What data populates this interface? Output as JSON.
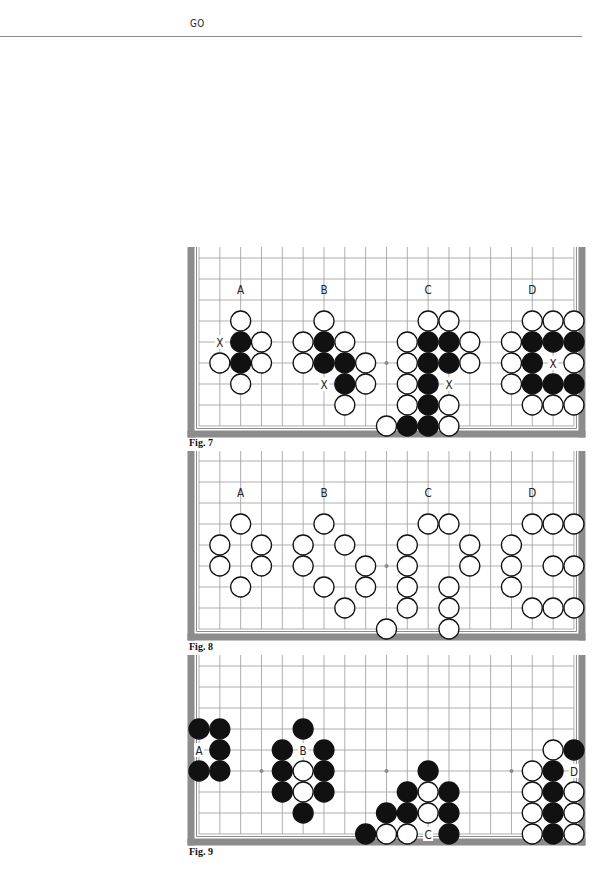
{
  "page": {
    "running_head": "GO"
  },
  "board": {
    "x0": 199,
    "col_spacing": 20.83,
    "row_spacing": 21,
    "cols": 19,
    "rows": 9,
    "stone_radius": 10,
    "frame_color": "#8c8c8c",
    "grid_color": "#9a9a9a",
    "star_points": [
      [
        3,
        5
      ],
      [
        9,
        5
      ],
      [
        15,
        5
      ]
    ]
  },
  "figures": [
    {
      "id": "fig7",
      "caption": "Fig. 7",
      "top": 247,
      "row0_y": 258,
      "caption_y": 437,
      "labels": [
        {
          "text": "A",
          "col": 2,
          "row": 1.5
        },
        {
          "text": "B",
          "col": 6,
          "row": 1.5
        },
        {
          "text": "C",
          "col": 11,
          "row": 1.5
        },
        {
          "text": "D",
          "col": 16,
          "row": 1.5
        },
        {
          "text": "X",
          "col": 1,
          "row": 4
        },
        {
          "text": "X",
          "col": 6,
          "row": 6
        },
        {
          "text": "X",
          "col": 12,
          "row": 6
        },
        {
          "text": "X",
          "col": 17,
          "row": 5
        }
      ],
      "stones": [
        {
          "c": "W",
          "col": 2,
          "row": 3
        },
        {
          "c": "B",
          "col": 2,
          "row": 4
        },
        {
          "c": "W",
          "col": 3,
          "row": 4
        },
        {
          "c": "W",
          "col": 1,
          "row": 5
        },
        {
          "c": "B",
          "col": 2,
          "row": 5
        },
        {
          "c": "W",
          "col": 3,
          "row": 5
        },
        {
          "c": "W",
          "col": 2,
          "row": 6
        },
        {
          "c": "W",
          "col": 6,
          "row": 3
        },
        {
          "c": "W",
          "col": 5,
          "row": 4
        },
        {
          "c": "B",
          "col": 6,
          "row": 4
        },
        {
          "c": "W",
          "col": 7,
          "row": 4
        },
        {
          "c": "W",
          "col": 5,
          "row": 5
        },
        {
          "c": "B",
          "col": 6,
          "row": 5
        },
        {
          "c": "B",
          "col": 7,
          "row": 5
        },
        {
          "c": "W",
          "col": 8,
          "row": 5
        },
        {
          "c": "B",
          "col": 7,
          "row": 6
        },
        {
          "c": "W",
          "col": 8,
          "row": 6
        },
        {
          "c": "W",
          "col": 7,
          "row": 7
        },
        {
          "c": "W",
          "col": 11,
          "row": 3
        },
        {
          "c": "W",
          "col": 12,
          "row": 3
        },
        {
          "c": "W",
          "col": 10,
          "row": 4
        },
        {
          "c": "B",
          "col": 11,
          "row": 4
        },
        {
          "c": "B",
          "col": 12,
          "row": 4
        },
        {
          "c": "W",
          "col": 13,
          "row": 4
        },
        {
          "c": "W",
          "col": 10,
          "row": 5
        },
        {
          "c": "B",
          "col": 11,
          "row": 5
        },
        {
          "c": "B",
          "col": 12,
          "row": 5
        },
        {
          "c": "W",
          "col": 13,
          "row": 5
        },
        {
          "c": "W",
          "col": 10,
          "row": 6
        },
        {
          "c": "B",
          "col": 11,
          "row": 6
        },
        {
          "c": "W",
          "col": 10,
          "row": 7
        },
        {
          "c": "B",
          "col": 11,
          "row": 7
        },
        {
          "c": "W",
          "col": 12,
          "row": 7
        },
        {
          "c": "W",
          "col": 9,
          "row": 8
        },
        {
          "c": "B",
          "col": 10,
          "row": 8
        },
        {
          "c": "B",
          "col": 11,
          "row": 8
        },
        {
          "c": "W",
          "col": 12,
          "row": 8
        },
        {
          "c": "W",
          "col": 16,
          "row": 3
        },
        {
          "c": "W",
          "col": 17,
          "row": 3
        },
        {
          "c": "W",
          "col": 18,
          "row": 3
        },
        {
          "c": "W",
          "col": 15,
          "row": 4
        },
        {
          "c": "B",
          "col": 16,
          "row": 4
        },
        {
          "c": "B",
          "col": 17,
          "row": 4
        },
        {
          "c": "B",
          "col": 18,
          "row": 4
        },
        {
          "c": "W",
          "col": 15,
          "row": 5
        },
        {
          "c": "B",
          "col": 16,
          "row": 5
        },
        {
          "c": "W",
          "col": 18,
          "row": 5
        },
        {
          "c": "W",
          "col": 15,
          "row": 6
        },
        {
          "c": "B",
          "col": 16,
          "row": 6
        },
        {
          "c": "B",
          "col": 17,
          "row": 6
        },
        {
          "c": "B",
          "col": 18,
          "row": 6
        },
        {
          "c": "W",
          "col": 16,
          "row": 7
        },
        {
          "c": "W",
          "col": 17,
          "row": 7
        },
        {
          "c": "W",
          "col": 18,
          "row": 7
        }
      ]
    },
    {
      "id": "fig8",
      "caption": "Fig. 8",
      "top": 451,
      "row0_y": 461,
      "caption_y": 641,
      "labels": [
        {
          "text": "A",
          "col": 2,
          "row": 1.5
        },
        {
          "text": "B",
          "col": 6,
          "row": 1.5
        },
        {
          "text": "C",
          "col": 11,
          "row": 1.5
        },
        {
          "text": "D",
          "col": 16,
          "row": 1.5
        }
      ],
      "stones": [
        {
          "c": "W",
          "col": 2,
          "row": 3
        },
        {
          "c": "W",
          "col": 1,
          "row": 4
        },
        {
          "c": "W",
          "col": 3,
          "row": 4
        },
        {
          "c": "W",
          "col": 1,
          "row": 5
        },
        {
          "c": "W",
          "col": 3,
          "row": 5
        },
        {
          "c": "W",
          "col": 2,
          "row": 6
        },
        {
          "c": "W",
          "col": 6,
          "row": 3
        },
        {
          "c": "W",
          "col": 5,
          "row": 4
        },
        {
          "c": "W",
          "col": 7,
          "row": 4
        },
        {
          "c": "W",
          "col": 5,
          "row": 5
        },
        {
          "c": "W",
          "col": 8,
          "row": 5
        },
        {
          "c": "W",
          "col": 6,
          "row": 6
        },
        {
          "c": "W",
          "col": 8,
          "row": 6
        },
        {
          "c": "W",
          "col": 7,
          "row": 7
        },
        {
          "c": "W",
          "col": 11,
          "row": 3
        },
        {
          "c": "W",
          "col": 12,
          "row": 3
        },
        {
          "c": "W",
          "col": 10,
          "row": 4
        },
        {
          "c": "W",
          "col": 13,
          "row": 4
        },
        {
          "c": "W",
          "col": 10,
          "row": 5
        },
        {
          "c": "W",
          "col": 13,
          "row": 5
        },
        {
          "c": "W",
          "col": 10,
          "row": 6
        },
        {
          "c": "W",
          "col": 12,
          "row": 6
        },
        {
          "c": "W",
          "col": 10,
          "row": 7
        },
        {
          "c": "W",
          "col": 12,
          "row": 7
        },
        {
          "c": "W",
          "col": 9,
          "row": 8
        },
        {
          "c": "W",
          "col": 12,
          "row": 8
        },
        {
          "c": "W",
          "col": 16,
          "row": 3
        },
        {
          "c": "W",
          "col": 17,
          "row": 3
        },
        {
          "c": "W",
          "col": 18,
          "row": 3
        },
        {
          "c": "W",
          "col": 15,
          "row": 4
        },
        {
          "c": "W",
          "col": 15,
          "row": 5
        },
        {
          "c": "W",
          "col": 17,
          "row": 5
        },
        {
          "c": "W",
          "col": 18,
          "row": 5
        },
        {
          "c": "W",
          "col": 15,
          "row": 6
        },
        {
          "c": "W",
          "col": 16,
          "row": 7
        },
        {
          "c": "W",
          "col": 17,
          "row": 7
        },
        {
          "c": "W",
          "col": 18,
          "row": 7
        }
      ]
    },
    {
      "id": "fig9",
      "caption": "Fig. 9",
      "top": 655,
      "row0_y": 666,
      "caption_y": 846,
      "labels": [
        {
          "text": "A",
          "col": 0,
          "row": 4
        },
        {
          "text": "B",
          "col": 5,
          "row": 4
        },
        {
          "text": "C",
          "col": 11,
          "row": 8
        },
        {
          "text": "D",
          "col": 18,
          "row": 5
        }
      ],
      "stones": [
        {
          "c": "B",
          "col": 0,
          "row": 3
        },
        {
          "c": "B",
          "col": 1,
          "row": 3
        },
        {
          "c": "B",
          "col": 1,
          "row": 4
        },
        {
          "c": "B",
          "col": 0,
          "row": 5
        },
        {
          "c": "B",
          "col": 1,
          "row": 5
        },
        {
          "c": "B",
          "col": 5,
          "row": 3
        },
        {
          "c": "B",
          "col": 4,
          "row": 4
        },
        {
          "c": "B",
          "col": 6,
          "row": 4
        },
        {
          "c": "B",
          "col": 4,
          "row": 5
        },
        {
          "c": "W",
          "col": 5,
          "row": 5
        },
        {
          "c": "B",
          "col": 6,
          "row": 5
        },
        {
          "c": "B",
          "col": 4,
          "row": 6
        },
        {
          "c": "W",
          "col": 5,
          "row": 6
        },
        {
          "c": "B",
          "col": 6,
          "row": 6
        },
        {
          "c": "B",
          "col": 5,
          "row": 7
        },
        {
          "c": "B",
          "col": 11,
          "row": 5
        },
        {
          "c": "B",
          "col": 10,
          "row": 6
        },
        {
          "c": "W",
          "col": 11,
          "row": 6
        },
        {
          "c": "B",
          "col": 12,
          "row": 6
        },
        {
          "c": "B",
          "col": 9,
          "row": 7
        },
        {
          "c": "B",
          "col": 10,
          "row": 7
        },
        {
          "c": "W",
          "col": 11,
          "row": 7
        },
        {
          "c": "B",
          "col": 12,
          "row": 7
        },
        {
          "c": "B",
          "col": 8,
          "row": 8
        },
        {
          "c": "W",
          "col": 9,
          "row": 8
        },
        {
          "c": "W",
          "col": 10,
          "row": 8
        },
        {
          "c": "B",
          "col": 12,
          "row": 8
        },
        {
          "c": "W",
          "col": 17,
          "row": 4
        },
        {
          "c": "B",
          "col": 18,
          "row": 4
        },
        {
          "c": "W",
          "col": 16,
          "row": 5
        },
        {
          "c": "B",
          "col": 17,
          "row": 5
        },
        {
          "c": "W",
          "col": 16,
          "row": 6
        },
        {
          "c": "B",
          "col": 17,
          "row": 6
        },
        {
          "c": "W",
          "col": 18,
          "row": 6
        },
        {
          "c": "W",
          "col": 16,
          "row": 7
        },
        {
          "c": "B",
          "col": 17,
          "row": 7
        },
        {
          "c": "W",
          "col": 18,
          "row": 7
        },
        {
          "c": "W",
          "col": 16,
          "row": 8
        },
        {
          "c": "B",
          "col": 17,
          "row": 8
        },
        {
          "c": "W",
          "col": 18,
          "row": 8
        }
      ]
    }
  ]
}
